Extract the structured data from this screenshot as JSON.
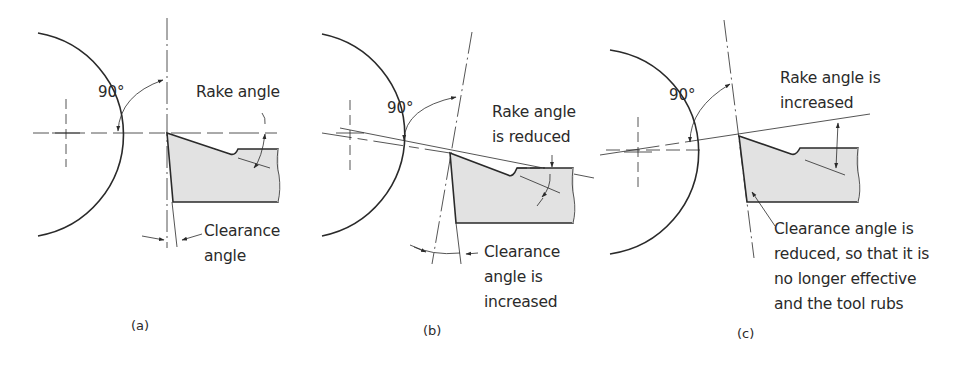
{
  "figure": {
    "panels": [
      {
        "id": "a",
        "caption": "(a)",
        "angle_label": "90°",
        "rake_label": [
          "Rake angle"
        ],
        "clearance_label": [
          "Clearance",
          "angle"
        ]
      },
      {
        "id": "b",
        "caption": "(b)",
        "angle_label": "90°",
        "rake_label": [
          "Rake angle",
          "is reduced"
        ],
        "clearance_label": [
          "Clearance",
          "angle is",
          "increased"
        ]
      },
      {
        "id": "c",
        "caption": "(c)",
        "angle_label": "90°",
        "rake_label": [
          "Rake angle is",
          "increased"
        ],
        "clearance_label": [
          "Clearance angle is",
          "reduced, so that it is",
          "no longer effective",
          "and the tool rubs"
        ]
      }
    ],
    "colors": {
      "line": "#2a2a2a",
      "tool_fill": "#e2e2e2",
      "background": "#ffffff"
    }
  }
}
